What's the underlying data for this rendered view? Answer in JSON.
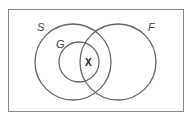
{
  "diagram": {
    "type": "venn",
    "sets": [
      {
        "label": "S",
        "cx": 73,
        "cy": 62,
        "r": 38
      },
      {
        "label": "F",
        "cx": 118,
        "cy": 62,
        "r": 38
      },
      {
        "label": "G",
        "cx": 79,
        "cy": 62,
        "r": 20
      }
    ],
    "marker": "X",
    "colors": {
      "stroke": "#666666",
      "frame": "#888888"
    }
  }
}
